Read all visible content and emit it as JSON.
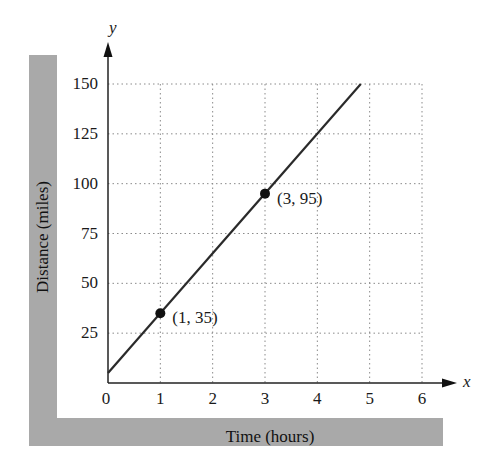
{
  "chart_data": {
    "type": "line",
    "title": "",
    "xlabel": "Time (hours)",
    "ylabel": "Distance (miles)",
    "x_axis_var": "x",
    "y_axis_var": "y",
    "xlim": [
      0,
      6
    ],
    "ylim": [
      0,
      150
    ],
    "x_ticks": [
      "0",
      "1",
      "2",
      "3",
      "4",
      "5",
      "6"
    ],
    "y_ticks": [
      "25",
      "50",
      "75",
      "100",
      "125",
      "150"
    ],
    "grid": true,
    "grid_style": "dotted",
    "series": [
      {
        "name": "distance",
        "equation": "y = 30x + 5",
        "x": [
          0,
          4.83
        ],
        "y": [
          5,
          150
        ],
        "color": "#2a2a2a"
      }
    ],
    "points": [
      {
        "x": 1,
        "y": 35,
        "label": "(1, 35)"
      },
      {
        "x": 3,
        "y": 95,
        "label": "(3, 95)"
      }
    ],
    "legend": null
  },
  "colors": {
    "band": "#a9a9a9",
    "line": "#2a2a2a",
    "grid": "#8a8a8a"
  }
}
